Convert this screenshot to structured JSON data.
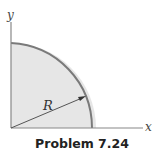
{
  "figure": {
    "x_axis_label": "x",
    "y_axis_label": "y",
    "radius_label": "R",
    "caption": "Problem 7.24"
  },
  "colors": {
    "fill": "#e6e6e6",
    "arc": "#7a7a7a",
    "axis": "#888888",
    "arrow": "#444444"
  }
}
